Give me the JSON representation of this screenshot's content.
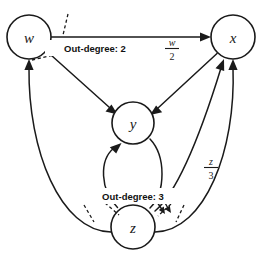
{
  "diagram": {
    "background_color": "#ffffff",
    "stroke_color": "#1a1a1a",
    "nodes": [
      {
        "id": "w",
        "label": "w",
        "cx": 29,
        "cy": 37,
        "r": 22
      },
      {
        "id": "x",
        "label": "x",
        "cx": 233,
        "cy": 37,
        "r": 22
      },
      {
        "id": "y",
        "label": "y",
        "cx": 133,
        "cy": 123,
        "r": 21
      },
      {
        "id": "z",
        "label": "z",
        "cx": 133,
        "cy": 227,
        "r": 22
      }
    ],
    "edges": [
      {
        "from": "w",
        "to": "x",
        "style": "straight"
      },
      {
        "from": "w",
        "to": "y",
        "style": "straight"
      },
      {
        "from": "x",
        "to": "y",
        "style": "straight"
      },
      {
        "from": "z",
        "to": "y",
        "style": "curved"
      },
      {
        "from": "y",
        "to": "z",
        "style": "curved"
      },
      {
        "from": "z",
        "to": "x",
        "style": "curved-inner"
      },
      {
        "from": "z",
        "to": "x",
        "style": "curved-outer"
      },
      {
        "from": "z",
        "to": "w",
        "style": "curved"
      }
    ],
    "edge_labels": [
      {
        "id": "wx-weight",
        "numerator": "w",
        "denominator": "2",
        "x": 172,
        "y": 47
      },
      {
        "id": "zx-weight",
        "numerator": "z",
        "denominator": "3",
        "x": 211,
        "y": 166
      }
    ],
    "callouts": [
      {
        "id": "out-degree-w",
        "text": "Out-degree: 2",
        "x": 95,
        "y": 48,
        "count": 2
      },
      {
        "id": "out-degree-z",
        "text": "Out-degree: 3",
        "x": 133,
        "y": 196,
        "count": 3
      }
    ]
  }
}
